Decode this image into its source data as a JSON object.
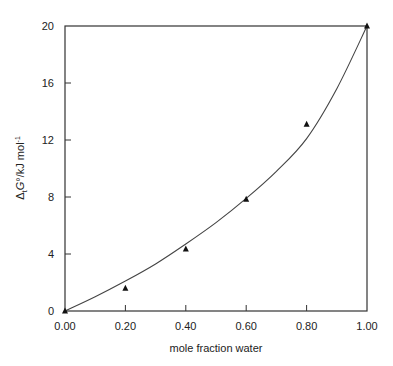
{
  "chart_data": {
    "type": "scatter",
    "title": "",
    "xlabel": "mole fraction water",
    "ylabel": "ΔtG°/kJ mol⁻¹",
    "ylabel_parts": {
      "delta": "Δ",
      "sub": "t",
      "G": "G",
      "rest": "°/kJ mol",
      "sup": "-1"
    },
    "xlim": [
      0,
      1.0
    ],
    "ylim": [
      0,
      20
    ],
    "x_ticks": [
      0.0,
      0.2,
      0.4,
      0.6,
      0.8,
      1.0
    ],
    "x_tick_labels": [
      "0.00",
      "0.20",
      "0.40",
      "0.60",
      "0.80",
      "1.00"
    ],
    "y_ticks": [
      0,
      4,
      8,
      12,
      16,
      20
    ],
    "y_tick_labels": [
      "0",
      "4",
      "8",
      "12",
      "16",
      "20"
    ],
    "grid": false,
    "legend": null,
    "series": [
      {
        "name": "experimental",
        "marker": "triangle",
        "x": [
          0.0,
          0.2,
          0.4,
          0.6,
          0.8,
          1.0
        ],
        "y": [
          0.0,
          1.6,
          4.35,
          7.85,
          13.1,
          20.0
        ]
      },
      {
        "name": "fitted curve",
        "marker": "line",
        "x": [
          0.0,
          0.1,
          0.2,
          0.3,
          0.4,
          0.5,
          0.6,
          0.7,
          0.8,
          0.9,
          1.0
        ],
        "y": [
          0.0,
          1.0,
          2.1,
          3.3,
          4.7,
          6.2,
          7.9,
          9.8,
          12.1,
          15.6,
          20.0
        ]
      }
    ]
  },
  "colors": {
    "axis": "#333333",
    "line": "#444444",
    "marker": "#111111"
  }
}
